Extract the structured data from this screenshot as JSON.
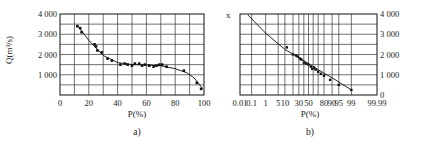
{
  "chart_data": [
    {
      "id": "a",
      "type": "scatter",
      "caption": "a)",
      "xlabel": "P(%)",
      "ylabel": "Q(m³/s)",
      "xlim": [
        0,
        100
      ],
      "ylim": [
        0,
        4000
      ],
      "xticks": [
        "0",
        "20",
        "40",
        "60",
        "80",
        "100"
      ],
      "yticks": [
        "1 000",
        "2 000",
        "3 000",
        "4 000"
      ],
      "grid": true,
      "series": [
        {
          "name": "observed",
          "marker": "square",
          "x": [
            12,
            14,
            15,
            24,
            25,
            26,
            29,
            33,
            36,
            42,
            45,
            47,
            50,
            52,
            55,
            57,
            59,
            62,
            65,
            67,
            69,
            71,
            74,
            86,
            95,
            98
          ],
          "y": [
            3400,
            3300,
            3100,
            2500,
            2400,
            2200,
            2100,
            1800,
            1700,
            1500,
            1550,
            1500,
            1450,
            1550,
            1550,
            1450,
            1500,
            1450,
            1400,
            1450,
            1500,
            1500,
            1400,
            1200,
            600,
            300
          ]
        },
        {
          "name": "fitted curve",
          "type": "line",
          "x": [
            12,
            20,
            30,
            40,
            50,
            60,
            70,
            80,
            88,
            93,
            96,
            99
          ],
          "y": [
            3450,
            2700,
            1950,
            1600,
            1500,
            1480,
            1440,
            1300,
            1100,
            850,
            600,
            300
          ]
        }
      ]
    },
    {
      "id": "b",
      "type": "scatter",
      "caption": "b)",
      "xlabel": "P(%)",
      "ylabel_top": "x",
      "xscale": "probability",
      "xlim": [
        0.01,
        99.99
      ],
      "ylim": [
        0,
        4000
      ],
      "xticks": [
        "0.01",
        "0.1",
        "1",
        "5",
        "10",
        "30",
        "50",
        "80",
        "90",
        "95",
        "99",
        "99.99"
      ],
      "yticks": [
        "0",
        "1 000",
        "2 000",
        "3 000",
        "4 000"
      ],
      "yaxis_side": "right",
      "grid": true,
      "series": [
        {
          "name": "observed",
          "marker": "square",
          "x": [
            12,
            20,
            25,
            28,
            32,
            35,
            40,
            45,
            50,
            55,
            58,
            62,
            65,
            70,
            75,
            80,
            88,
            95,
            99
          ],
          "y": [
            2350,
            2000,
            1950,
            1900,
            1800,
            1750,
            1600,
            1550,
            1500,
            1400,
            1300,
            1350,
            1250,
            1150,
            1050,
            950,
            750,
            500,
            250
          ]
        },
        {
          "name": "fitted line",
          "type": "line",
          "x": [
            0.05,
            1,
            10,
            30,
            50,
            70,
            90,
            99
          ],
          "y": [
            3950,
            3050,
            2250,
            1850,
            1550,
            1250,
            850,
            250
          ]
        }
      ]
    }
  ],
  "labels": {
    "a_caption": "a)",
    "b_caption": "b)",
    "a_xlabel": "P(%)",
    "b_xlabel": "P(%)",
    "a_ylabel": "Q(m³/s)",
    "b_ylabel_top": "x"
  }
}
